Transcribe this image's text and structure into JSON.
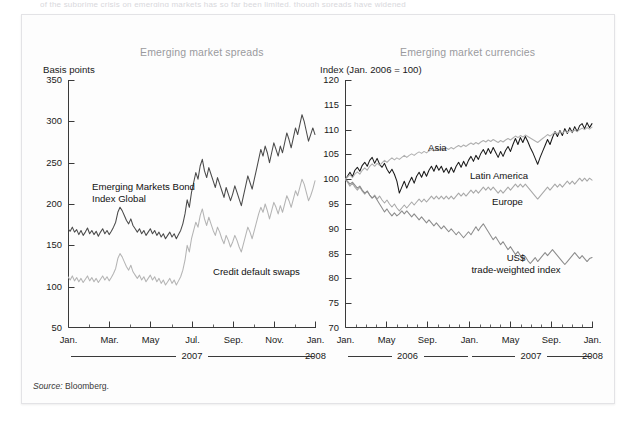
{
  "figure": {
    "top_clipped_text": "of the subprime crisis on emerging markets has so far been limited, though spreads have widened",
    "source_prefix": "Source:",
    "source_value": "Bloomberg.",
    "colors": {
      "panel_background": "#fdfdfd",
      "panel_border": "#e3e3e6",
      "title_gray": "#9a9a9e",
      "axis_black": "#3a3a3a",
      "series_dark": "#4a4a4a",
      "series_light": "#b4b4b4",
      "series_black": "#1a1a1a",
      "series_mid": "#8c8c8c"
    }
  },
  "chart_data": [
    {
      "type": "line",
      "id": "emerging-market-spreads",
      "title": "Emerging market spreads",
      "ylabel": "Basis points",
      "xlabel": "",
      "ylim": [
        50,
        350
      ],
      "yticks": [
        350,
        300,
        250,
        200,
        150,
        100,
        50
      ],
      "grid": false,
      "legend": "in-plot annotations",
      "xticks": [
        "Jan.",
        "Mar.",
        "May",
        "Jul.",
        "Sep.",
        "Nov.",
        "Jan."
      ],
      "x_year_groups": [
        {
          "label": "2007",
          "rule": true
        },
        {
          "label": "2008",
          "rule": false
        }
      ],
      "annotations": [
        {
          "text": "Emerging Markets Bond\nIndex Global",
          "series": "EMBI Global"
        },
        {
          "text": "Credit default swaps",
          "series": "Credit default swaps"
        }
      ],
      "series": [
        {
          "name": "Emerging Markets Bond Index Global",
          "color": "#4a4a4a",
          "values": [
            170,
            167,
            172,
            166,
            169,
            163,
            168,
            162,
            166,
            171,
            164,
            168,
            163,
            167,
            161,
            166,
            170,
            164,
            168,
            163,
            167,
            172,
            178,
            190,
            196,
            192,
            186,
            180,
            176,
            182,
            174,
            170,
            166,
            170,
            164,
            168,
            162,
            166,
            170,
            164,
            168,
            162,
            166,
            160,
            164,
            158,
            162,
            166,
            160,
            164,
            158,
            163,
            168,
            176,
            188,
            205,
            196,
            214,
            226,
            238,
            230,
            246,
            254,
            240,
            232,
            244,
            236,
            228,
            220,
            232,
            224,
            216,
            208,
            220,
            212,
            204,
            212,
            222,
            214,
            206,
            198,
            210,
            222,
            234,
            226,
            218,
            230,
            242,
            254,
            266,
            258,
            270,
            262,
            250,
            262,
            274,
            266,
            258,
            270,
            262,
            274,
            286,
            278,
            268,
            280,
            292,
            284,
            296,
            308,
            300,
            288,
            276,
            284,
            292,
            284
          ]
        },
        {
          "name": "Credit default swaps",
          "color": "#b4b4b4",
          "values": [
            112,
            108,
            113,
            107,
            111,
            106,
            110,
            105,
            109,
            113,
            107,
            111,
            106,
            110,
            105,
            109,
            113,
            108,
            112,
            107,
            111,
            116,
            122,
            134,
            140,
            136,
            130,
            124,
            120,
            126,
            118,
            114,
            110,
            114,
            108,
            112,
            106,
            110,
            114,
            108,
            112,
            106,
            110,
            104,
            108,
            102,
            106,
            110,
            104,
            108,
            102,
            107,
            112,
            120,
            132,
            150,
            142,
            158,
            168,
            178,
            172,
            186,
            194,
            182,
            174,
            184,
            176,
            168,
            162,
            172,
            166,
            158,
            152,
            162,
            156,
            148,
            154,
            162,
            156,
            148,
            142,
            152,
            162,
            172,
            166,
            158,
            168,
            178,
            188,
            196,
            190,
            200,
            192,
            182,
            192,
            202,
            196,
            188,
            198,
            190,
            200,
            210,
            204,
            196,
            206,
            216,
            210,
            220,
            230,
            224,
            214,
            204,
            210,
            218,
            228
          ]
        }
      ]
    },
    {
      "type": "line",
      "id": "emerging-market-currencies",
      "title": "Emerging market currencies",
      "ylabel": "Index (Jan. 2006 = 100)",
      "xlabel": "",
      "ylim": [
        70,
        120
      ],
      "yticks": [
        120,
        115,
        110,
        105,
        100,
        95,
        90,
        85,
        80,
        75,
        70
      ],
      "grid": false,
      "legend": "in-plot annotations",
      "xticks": [
        "Jan.",
        "May",
        "Sep.",
        "Jan.",
        "May",
        "Sep.",
        "Jan."
      ],
      "x_year_groups": [
        {
          "label": "2006",
          "rule": true
        },
        {
          "label": "2007",
          "rule": true
        },
        {
          "label": "2008",
          "rule": false
        }
      ],
      "annotations": [
        {
          "text": "Asia",
          "series": "Asia"
        },
        {
          "text": "Latin America",
          "series": "Latin America"
        },
        {
          "text": "Europe",
          "series": "Europe"
        },
        {
          "text": "US$\ntrade-weighted index",
          "series": "US$ trade-weighted index"
        }
      ],
      "series": [
        {
          "name": "Latin America",
          "color": "#1a1a1a",
          "values": [
            100,
            100.6,
            101.4,
            100.5,
            101.8,
            102.4,
            101.6,
            102.8,
            103.4,
            102.6,
            103.8,
            104.4,
            103.2,
            104.2,
            103.0,
            102.4,
            103.2,
            102.0,
            101.2,
            102.0,
            101.0,
            99.6,
            97.2,
            98.4,
            99.6,
            98.2,
            99.4,
            100.4,
            99.2,
            100.6,
            101.4,
            100.4,
            101.6,
            100.6,
            101.8,
            102.6,
            101.6,
            102.8,
            101.8,
            102.6,
            101.4,
            102.2,
            101.2,
            102.4,
            101.4,
            102.6,
            103.4,
            102.4,
            103.6,
            102.6,
            103.8,
            104.6,
            103.6,
            104.8,
            104.0,
            105.2,
            106.0,
            105.0,
            106.2,
            105.2,
            106.4,
            105.4,
            104.4,
            105.6,
            104.6,
            105.8,
            106.6,
            105.6,
            107.0,
            108.2,
            107.0,
            108.4,
            107.4,
            108.6,
            107.6,
            106.4,
            105.4,
            104.2,
            103.0,
            104.4,
            105.6,
            106.8,
            108.0,
            107.0,
            108.4,
            109.6,
            108.6,
            109.8,
            108.8,
            110.2,
            109.2,
            110.4,
            109.4,
            110.6,
            109.6,
            110.8,
            111.2,
            110.2,
            111.4,
            110.4,
            111.2
          ]
        },
        {
          "name": "Asia",
          "color": "#b0b0b0",
          "values": [
            100,
            100.4,
            100.9,
            100.3,
            101.0,
            101.5,
            101.0,
            101.8,
            102.3,
            101.8,
            102.6,
            103.1,
            102.6,
            103.2,
            102.8,
            103.3,
            103.8,
            103.4,
            103.9,
            104.3,
            103.9,
            104.3,
            104.0,
            104.4,
            104.8,
            104.4,
            104.8,
            105.1,
            104.8,
            105.2,
            105.5,
            105.2,
            105.6,
            105.3,
            105.7,
            106.0,
            105.7,
            106.1,
            105.8,
            106.2,
            105.9,
            106.3,
            106.0,
            106.4,
            106.1,
            106.5,
            106.8,
            106.5,
            106.9,
            106.6,
            107.0,
            107.3,
            107.0,
            107.4,
            107.1,
            107.5,
            107.8,
            107.5,
            107.9,
            107.6,
            108.0,
            107.7,
            107.4,
            107.8,
            107.5,
            107.9,
            108.2,
            107.9,
            108.3,
            108.7,
            108.4,
            108.8,
            108.5,
            108.9,
            108.6,
            108.3,
            108.0,
            107.7,
            107.4,
            107.8,
            108.2,
            108.6,
            109.0,
            108.7,
            109.1,
            109.5,
            109.2,
            109.6,
            109.3,
            109.7,
            109.4,
            109.8,
            109.5,
            109.9,
            109.6,
            110.0,
            110.3,
            110.0,
            110.4,
            110.1,
            110.5
          ]
        },
        {
          "name": "Europe",
          "color": "#a8a8a8",
          "values": [
            100,
            99.4,
            98.6,
            99.2,
            98.4,
            97.8,
            98.4,
            97.6,
            97.0,
            97.6,
            96.8,
            96.2,
            96.8,
            96.0,
            96.6,
            95.8,
            95.2,
            95.8,
            95.0,
            94.4,
            95.0,
            94.2,
            93.6,
            94.2,
            94.8,
            94.2,
            94.8,
            95.4,
            94.8,
            95.4,
            96.0,
            95.4,
            96.0,
            95.4,
            96.0,
            96.6,
            96.0,
            96.6,
            96.0,
            96.6,
            96.0,
            96.6,
            96.0,
            96.6,
            96.0,
            96.6,
            97.2,
            96.6,
            97.2,
            96.6,
            97.2,
            97.8,
            97.2,
            97.8,
            97.2,
            97.8,
            98.4,
            97.8,
            98.4,
            97.8,
            98.4,
            97.8,
            97.2,
            97.8,
            97.2,
            97.8,
            98.4,
            97.8,
            98.4,
            99.0,
            98.4,
            99.0,
            98.4,
            99.0,
            98.4,
            97.8,
            97.2,
            96.6,
            96.0,
            96.6,
            97.2,
            97.8,
            98.4,
            97.8,
            98.4,
            99.0,
            98.4,
            99.0,
            98.4,
            99.0,
            99.6,
            99.0,
            99.6,
            99.0,
            99.6,
            100.2,
            99.6,
            100.2,
            99.6,
            100.2,
            99.8
          ]
        },
        {
          "name": "US$ trade-weighted index",
          "color": "#8c8c8c",
          "values": [
            100,
            99.6,
            99.0,
            99.4,
            98.8,
            98.2,
            98.6,
            97.8,
            97.2,
            97.6,
            96.8,
            96.2,
            96.6,
            95.8,
            95.0,
            94.2,
            93.4,
            94.0,
            93.2,
            92.6,
            93.2,
            92.6,
            93.0,
            93.6,
            93.0,
            93.6,
            93.0,
            92.4,
            93.0,
            92.4,
            91.8,
            92.4,
            91.8,
            91.2,
            91.8,
            91.2,
            90.6,
            91.2,
            90.6,
            90.0,
            90.6,
            90.0,
            89.4,
            90.0,
            89.4,
            88.8,
            89.4,
            88.8,
            88.2,
            88.8,
            89.4,
            88.8,
            89.6,
            90.4,
            89.6,
            90.4,
            91.0,
            90.2,
            89.4,
            88.6,
            87.8,
            88.4,
            87.6,
            86.8,
            87.4,
            86.6,
            85.8,
            86.4,
            85.6,
            84.8,
            85.4,
            84.6,
            83.8,
            84.4,
            83.6,
            83.0,
            83.6,
            84.2,
            83.4,
            84.0,
            84.6,
            85.2,
            84.6,
            85.2,
            85.8,
            85.2,
            84.6,
            84.0,
            83.4,
            82.8,
            83.4,
            84.0,
            84.6,
            85.2,
            84.6,
            84.0,
            84.6,
            84.0,
            83.4,
            84.0,
            84.2
          ]
        }
      ]
    }
  ]
}
